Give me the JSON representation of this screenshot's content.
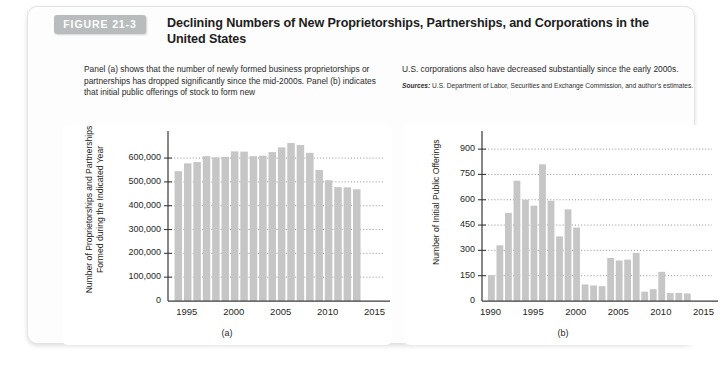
{
  "figure": {
    "badge": "FIGURE 21-3",
    "title": "Declining Numbers of New Proprietorships, Partnerships, and Corporations in the United States",
    "caption_left": "Panel (a) shows that the number of newly formed business proprietorships or partnerships has dropped significantly since the mid-2000s. Panel (b) indicates that initial public offerings of stock to form new",
    "caption_right": "U.S. corporations also have decreased substantially since the early 2000s.",
    "sources_lead": "Sources:",
    "sources_text": " U.S. Department of Labor, Securities and Exchange Commission, and author's estimates.",
    "panel_a_letter": "(a)",
    "panel_b_letter": "(b)",
    "colors": {
      "bar": "#c6c6c6",
      "badge": "#b9bcbd",
      "axis": "#3d3d3d",
      "grid": "#7d7d7d",
      "card_bg": "#fdfdfd"
    }
  },
  "chart_data": [
    {
      "type": "bar",
      "id": "panel-a",
      "title": "",
      "xlabel": "",
      "ylabel": "Number of Proprietorships and Partnerships Formed during the Indicated Year",
      "ylim": [
        0,
        680000
      ],
      "xlim": [
        1993,
        2016
      ],
      "grid": true,
      "legend": "none",
      "ytick_labels": [
        "0",
        "100,000",
        "200,000",
        "300,000",
        "400,000",
        "500,000",
        "600,000"
      ],
      "ytick_values": [
        0,
        100000,
        200000,
        300000,
        400000,
        500000,
        600000
      ],
      "xtick_labels": [
        "1995",
        "2000",
        "2005",
        "2010",
        "2015"
      ],
      "xtick_values": [
        1995,
        2000,
        2005,
        2010,
        2015
      ],
      "categories": [
        1994,
        1995,
        1996,
        1997,
        1998,
        1999,
        2000,
        2001,
        2002,
        2003,
        2004,
        2005,
        2006,
        2007,
        2008,
        2009,
        2010,
        2011,
        2012,
        2013
      ],
      "values": [
        545000,
        578000,
        583000,
        608000,
        603000,
        605000,
        628000,
        627000,
        608000,
        610000,
        625000,
        645000,
        663000,
        655000,
        622000,
        550000,
        507000,
        478000,
        477000,
        469000
      ]
    },
    {
      "type": "bar",
      "id": "panel-b",
      "title": "",
      "xlabel": "",
      "ylabel": "Number of Initial Public Offerings",
      "ylim": [
        0,
        960
      ],
      "xlim": [
        1989,
        2016
      ],
      "grid": true,
      "legend": "none",
      "ytick_labels": [
        "0",
        "150",
        "300",
        "450",
        "600",
        "750",
        "900"
      ],
      "ytick_values": [
        0,
        150,
        300,
        450,
        600,
        750,
        900
      ],
      "xtick_labels": [
        "1990",
        "1995",
        "2000",
        "2005",
        "2010",
        "2015"
      ],
      "xtick_values": [
        1990,
        1995,
        2000,
        2005,
        2010,
        2015
      ],
      "categories": [
        1990,
        1991,
        1992,
        1993,
        1994,
        1995,
        1996,
        1997,
        1998,
        1999,
        2000,
        2001,
        2002,
        2003,
        2004,
        2005,
        2006,
        2007,
        2008,
        2009,
        2010,
        2011,
        2012,
        2013
      ],
      "values": [
        153,
        330,
        522,
        713,
        600,
        565,
        810,
        594,
        383,
        543,
        435,
        98,
        92,
        88,
        255,
        240,
        245,
        285,
        55,
        70,
        173,
        47,
        48,
        45
      ]
    }
  ]
}
